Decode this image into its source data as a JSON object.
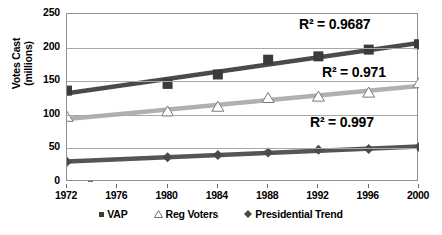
{
  "chart_data": {
    "type": "line",
    "title": "",
    "xlabel": "",
    "ylabel": "Votes Cast (millions)",
    "ylabel_lines": [
      "Votes Cast",
      "(millions)"
    ],
    "x": [
      1972,
      1976,
      1980,
      1984,
      1988,
      1992,
      1996,
      2000
    ],
    "xticklabels": [
      "1972",
      "1976",
      "1980",
      "1984",
      "1988",
      "1992",
      "1996",
      "2000"
    ],
    "yticklabels": [
      "0",
      "50",
      "100",
      "150",
      "200",
      "250"
    ],
    "yticks": [
      0,
      50,
      100,
      150,
      200,
      250
    ],
    "ylim": [
      0,
      250
    ],
    "xlim": [
      1972,
      2000
    ],
    "grid": "horizontal",
    "legend_position": "bottom",
    "series": [
      {
        "name": "VAP",
        "marker": "filled-square",
        "color": "#3a3a3a",
        "line_color": "#4a4a4a",
        "x": [
          1972,
          1980,
          1984,
          1988,
          1992,
          1996,
          2000
        ],
        "values": [
          136,
          146,
          160,
          182,
          187,
          197,
          205
        ],
        "r2": "R² = 0.9687"
      },
      {
        "name": "Reg Voters",
        "marker": "open-triangle",
        "color": "#ffffff",
        "line_color": "#b0b0b0",
        "x": [
          1972,
          1980,
          1984,
          1988,
          1992,
          1996,
          2000
        ],
        "values": [
          97,
          105,
          112,
          125,
          127,
          133,
          147
        ],
        "r2": "R² = 0.971"
      },
      {
        "name": "Presidential Trend",
        "marker": "filled-diamond",
        "color": "#4a4a4a",
        "line_color": "#555555",
        "x": [
          1972,
          1980,
          1984,
          1988,
          1992,
          1996,
          2000
        ],
        "values": [
          30,
          37,
          40,
          44,
          48,
          49,
          52
        ],
        "r2": "R² = 0.997"
      }
    ],
    "annotations": [
      {
        "text": "R² = 0.9687",
        "series": "VAP"
      },
      {
        "text": "R² = 0.971",
        "series": "Reg Voters"
      },
      {
        "text": "R² = 0.997",
        "series": "Presidential Trend"
      }
    ]
  },
  "legend": {
    "items": [
      {
        "label": "VAP",
        "icon": "filled-square-marker-icon"
      },
      {
        "label": "Reg Voters",
        "icon": "open-triangle-marker-icon"
      },
      {
        "label": "Presidential Trend",
        "icon": "filled-diamond-marker-icon"
      }
    ]
  }
}
